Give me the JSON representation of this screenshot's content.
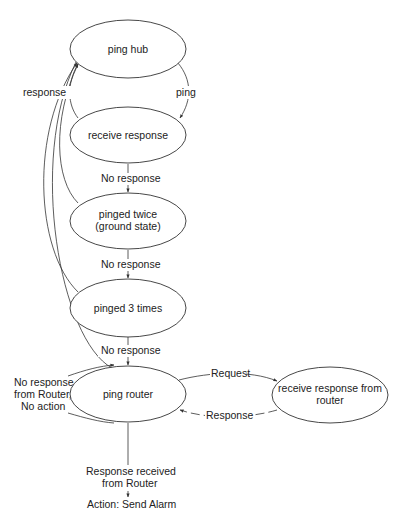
{
  "diagram": {
    "type": "state-diagram",
    "nodes": [
      {
        "id": "ping_hub",
        "label": "ping hub"
      },
      {
        "id": "receive_response",
        "label": "receive response"
      },
      {
        "id": "pinged_twice",
        "label_line1": "pinged twice",
        "label_line2": "(ground state)"
      },
      {
        "id": "pinged_3_times",
        "label": "pinged 3 times"
      },
      {
        "id": "ping_router",
        "label": "ping router"
      },
      {
        "id": "receive_response_router",
        "label_line1": "receive response from",
        "label_line2": "router"
      }
    ],
    "edges": {
      "ping": "ping",
      "response": "response",
      "no_response_1": "No response",
      "no_response_2": "No response",
      "no_response_3": "No response",
      "request": "Request",
      "router_response": "Response",
      "no_response_router_line1": "No response",
      "no_response_router_line2": "from Router,",
      "no_response_router_line3": "No action",
      "response_received_line1": "Response  received",
      "response_received_line2": "from Router",
      "response_received_line3": "Action: Send Alarm"
    },
    "colors": {
      "stroke": "#333333",
      "text": "#222222",
      "background": "#ffffff"
    }
  }
}
